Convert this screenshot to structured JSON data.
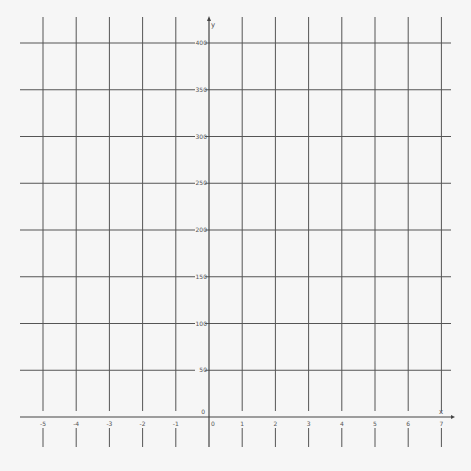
{
  "chart_data": {
    "type": "line",
    "title": "",
    "xlabel": "x",
    "ylabel": "y",
    "xlim": [
      -5.5,
      7.3
    ],
    "ylim": [
      0,
      410
    ],
    "x_ticks": [
      -5,
      -4,
      -3,
      -2,
      -1,
      0,
      1,
      2,
      3,
      4,
      5,
      6,
      7
    ],
    "x_tick_labels": [
      "-5",
      "-4",
      "-3",
      "-2",
      "-1",
      "0",
      "1",
      "2",
      "3",
      "4",
      "5",
      "6",
      "7"
    ],
    "y_ticks": [
      0,
      50,
      100,
      150,
      200,
      250,
      300,
      350,
      400
    ],
    "y_tick_labels": [
      "0",
      "50",
      "100",
      "150",
      "200",
      "250",
      "300",
      "350",
      "400"
    ],
    "grid": true,
    "series": [],
    "colors": {
      "background": "#f6f6f6",
      "grid": "#555555",
      "axis": "#444444",
      "text": "#555555"
    }
  }
}
